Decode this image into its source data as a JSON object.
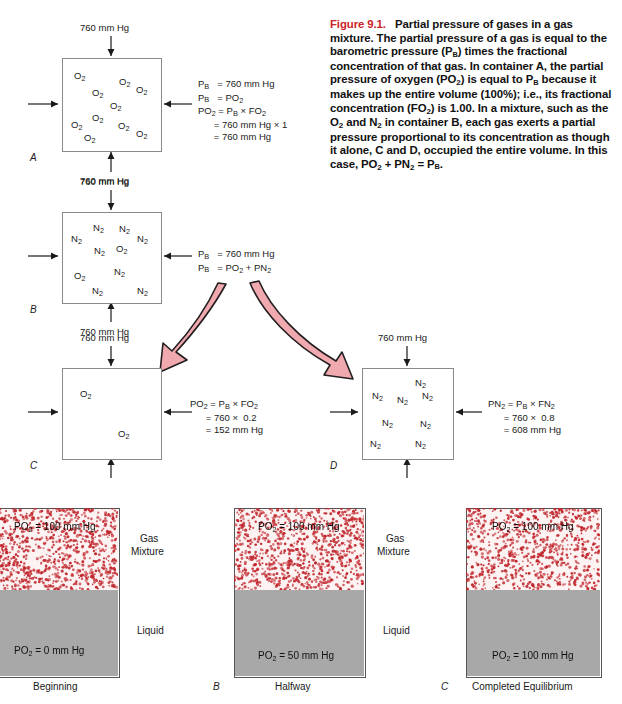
{
  "figure": {
    "number": "Figure 9.1.",
    "caption_text": "Partial pressure of gases in a gas mixture. The partial pressure of a gas is equal to the barometric pressure (PB) times the fractional concentration of that gas. In container A, the partial pressure of oxygen (PO2) is equal to PB because it makes up the entire volume (100%); i.e., its fractional concentration (FO2) is 1.00. In a mixture, such as the O2 and N2 in container B, each gas exerts a partial pressure proportional to its concentration as though it alone, C and D, occupied the entire volume. In this case, PO2 + PN2 = PB."
  },
  "containers": {
    "A": {
      "letter": "A",
      "pressure_top": "760 mm Hg",
      "pressure_bottom": "760 mm Hg",
      "gas_labels": [
        "O2",
        "O2",
        "O2",
        "O2",
        "O2",
        "O2",
        "O2",
        "O2",
        "O2",
        "O2"
      ],
      "equations": [
        "PB  = 760 mm Hg",
        "PB  = PO2",
        "PO2 = PB × FO2",
        "      = 760 mm Hg × 1",
        "      = 760 mm Hg"
      ]
    },
    "B": {
      "letter": "B",
      "pressure_top": "760 mm Hg",
      "pressure_bottom": "760 mm Hg",
      "gas_labels": [
        "N2",
        "N2",
        "N2",
        "N2",
        "N2",
        "O2",
        "N2",
        "O2",
        "N2",
        "N2",
        "N2"
      ],
      "equations": [
        "PB  = 760 mm Hg",
        "PB  = PO2 + PN2"
      ]
    },
    "C": {
      "letter": "C",
      "pressure_top": "760 mm Hg",
      "gas_labels": [
        "O2",
        "O2"
      ],
      "equations": [
        "PO2 = PB × FO2",
        "      = 760 ×  0.2",
        "      = 152 mm Hg"
      ]
    },
    "D": {
      "letter": "D",
      "pressure_top": "760 mm Hg",
      "gas_labels": [
        "N2",
        "N2",
        "N2",
        "N2",
        "N2",
        "N2",
        "N2"
      ],
      "equations": [
        "PN2 = PB × FN2",
        "      = 760 ×  0.8",
        "      = 608 mm Hg"
      ]
    }
  },
  "equilibrium_panels": [
    {
      "letter": "A",
      "caption": "Beginning",
      "gas_value": "PO2 = 100 mm Hg",
      "liquid_value": "PO2 = 0 mm Hg",
      "side_label_gas": "Gas",
      "side_label_gas2": "Mixture",
      "side_label_liquid": "Liquid",
      "arrows_down": 3,
      "arrows_up": 0
    },
    {
      "letter": "B",
      "caption": "Halfway",
      "gas_value": "PO2 = 100 mm Hg",
      "liquid_value": "PO2 = 50 mm Hg",
      "side_label_gas": "Gas",
      "side_label_gas2": "Mixture",
      "side_label_liquid": "Liquid",
      "arrows_down": 3,
      "arrows_up": 2
    },
    {
      "letter": "C",
      "caption": "Completed Equilibrium",
      "gas_value": "PO2 = 100 mm Hg",
      "liquid_value": "PO2 = 100 mm Hg",
      "side_label_gas": "",
      "side_label_gas2": "",
      "side_label_liquid": "",
      "arrows_down": 3,
      "arrows_up": 3
    }
  ],
  "colors": {
    "accent_red": "#cc2229",
    "pink_arrow_fill": "#f0a9ae",
    "pink_arrow_stroke": "#231f20",
    "gas_bg": "#fdf3f3",
    "liquid_bg": "#a8a8a8",
    "dot_color": "#c0272d",
    "box_stroke": "#8a8a8a"
  }
}
